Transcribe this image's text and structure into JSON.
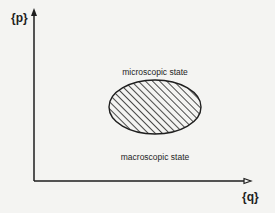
{
  "diagram": {
    "axes": {
      "y_label": "{p}",
      "x_label": "{q}"
    },
    "labels": {
      "upper": "microscopic state",
      "lower": "macroscopic state"
    },
    "region": {
      "shape": "ellipse",
      "fill": "diagonal-hatch"
    },
    "colors": {
      "background": "#f4f4f2",
      "ink": "#1e1e1e"
    }
  }
}
